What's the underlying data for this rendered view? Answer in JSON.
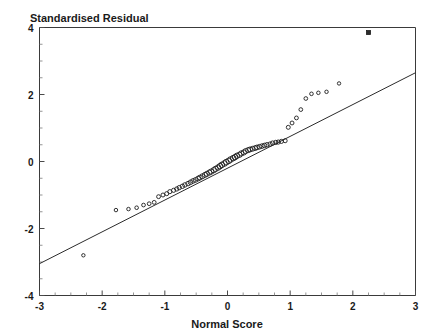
{
  "chart_data": {
    "type": "scatter",
    "title": "",
    "xlabel": "Normal Score",
    "ylabel": "Standardised Residual",
    "xlim": [
      -3,
      3
    ],
    "ylim": [
      -4,
      4
    ],
    "grid": false,
    "legend": "none",
    "xticks": [
      -3,
      -2,
      -1,
      0,
      1,
      2,
      3
    ],
    "xtick_labels": [
      "-3",
      "-2",
      "-1",
      "0",
      "1",
      "2",
      "3"
    ],
    "yticks": [
      -4,
      -2,
      0,
      2,
      4
    ],
    "ytick_labels": [
      "-4",
      "-2",
      "0",
      "2",
      "4"
    ],
    "x_minor_step": 0.25,
    "y_minor_step": 0.5,
    "marker": "open-circle",
    "series": [
      {
        "name": "sample quantiles",
        "x": [
          -2.3,
          -1.78,
          -1.58,
          -1.45,
          -1.34,
          -1.25,
          -1.17,
          -1.1,
          -1.03,
          -0.97,
          -0.92,
          -0.86,
          -0.81,
          -0.77,
          -0.72,
          -0.68,
          -0.63,
          -0.59,
          -0.55,
          -0.51,
          -0.47,
          -0.44,
          -0.4,
          -0.36,
          -0.33,
          -0.29,
          -0.26,
          -0.22,
          -0.19,
          -0.15,
          -0.12,
          -0.09,
          -0.05,
          -0.02,
          0.02,
          0.05,
          0.09,
          0.12,
          0.15,
          0.19,
          0.22,
          0.26,
          0.29,
          0.33,
          0.36,
          0.4,
          0.44,
          0.47,
          0.51,
          0.55,
          0.59,
          0.63,
          0.68,
          0.72,
          0.77,
          0.81,
          0.86,
          0.92,
          0.97,
          1.03,
          1.1,
          1.17,
          1.25,
          1.34,
          1.45,
          1.58,
          1.78
        ],
        "y": [
          -2.8,
          -1.45,
          -1.42,
          -1.38,
          -1.3,
          -1.26,
          -1.22,
          -1.05,
          -1.0,
          -0.96,
          -0.9,
          -0.86,
          -0.82,
          -0.78,
          -0.74,
          -0.7,
          -0.66,
          -0.62,
          -0.58,
          -0.55,
          -0.51,
          -0.48,
          -0.44,
          -0.4,
          -0.37,
          -0.33,
          -0.3,
          -0.26,
          -0.22,
          -0.18,
          -0.14,
          -0.1,
          -0.06,
          -0.02,
          0.02,
          0.06,
          0.1,
          0.13,
          0.17,
          0.2,
          0.24,
          0.27,
          0.31,
          0.34,
          0.36,
          0.38,
          0.4,
          0.42,
          0.44,
          0.46,
          0.48,
          0.5,
          0.52,
          0.55,
          0.57,
          0.58,
          0.6,
          0.62,
          1.02,
          1.15,
          1.3,
          1.55,
          1.88,
          2.02,
          2.05,
          2.08,
          2.33
        ]
      },
      {
        "name": "outlier",
        "marker": "filled-square",
        "x": [
          2.25
        ],
        "y": [
          3.85
        ]
      }
    ],
    "reference_line": {
      "name": "normal reference line",
      "x": [
        -3,
        3
      ],
      "y": [
        -3.05,
        2.65
      ]
    }
  }
}
